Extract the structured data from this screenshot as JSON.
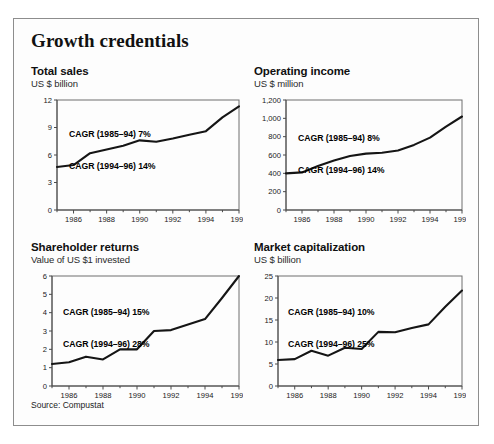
{
  "exhibit": {
    "title": "Growth credentials",
    "source": "Source: Compustat"
  },
  "panels": [
    {
      "key": "total-sales",
      "title": "Total sales",
      "subtitle": "US $ billion",
      "cagr_line1": "CAGR (1985–94) 7%",
      "cagr_line2": "CAGR (1994–96) 14%"
    },
    {
      "key": "operating-income",
      "title": "Operating income",
      "subtitle": "US $ million",
      "cagr_line1": "CAGR (1985–94) 8%",
      "cagr_line2": "CAGR (1994–96) 14%"
    },
    {
      "key": "shareholder-returns",
      "title": "Shareholder returns",
      "subtitle": "Value of US $1 invested",
      "cagr_line1": "CAGR (1985–94) 15%",
      "cagr_line2": "CAGR (1994–96) 28%"
    },
    {
      "key": "market-capitalization",
      "title": "Market capitalization",
      "subtitle": "US $ billion",
      "cagr_line1": "CAGR (1985–94) 10%",
      "cagr_line2": "CAGR (1994–96) 25%"
    }
  ],
  "chart_data": [
    {
      "type": "line",
      "title": "Total sales",
      "subtitle": "US $ billion",
      "xlabel": "",
      "ylabel": "US $ billion",
      "x": [
        1985,
        1986,
        1987,
        1988,
        1989,
        1990,
        1991,
        1992,
        1993,
        1994,
        1995,
        1996
      ],
      "values": [
        4.7,
        4.9,
        6.2,
        6.6,
        7.0,
        7.6,
        7.45,
        7.8,
        8.2,
        8.6,
        10.1,
        11.3
      ],
      "xlim": [
        1985,
        1996
      ],
      "ylim": [
        0,
        12
      ],
      "yticks": [
        0,
        3,
        6,
        9,
        12
      ],
      "yticklabels": [
        "0",
        "3",
        "6",
        "9",
        "12"
      ],
      "xticks": [
        1986,
        1988,
        1990,
        1992,
        1994,
        1996
      ],
      "xticklabels": [
        "1986",
        "1988",
        "1990",
        "1992",
        "1994",
        "1996"
      ],
      "grid": false,
      "legend": "none",
      "annotations": [
        "CAGR (1985–94) 7%",
        "CAGR (1994–96) 14%"
      ]
    },
    {
      "type": "line",
      "title": "Operating income",
      "subtitle": "US $ million",
      "xlabel": "",
      "ylabel": "US $ million",
      "x": [
        1985,
        1986,
        1987,
        1988,
        1989,
        1990,
        1991,
        1992,
        1993,
        1994,
        1995,
        1996
      ],
      "values": [
        400,
        410,
        480,
        540,
        590,
        615,
        625,
        650,
        710,
        790,
        910,
        1020
      ],
      "xlim": [
        1985,
        1996
      ],
      "ylim": [
        0,
        1200
      ],
      "yticks": [
        0,
        200,
        400,
        600,
        800,
        1000,
        1200
      ],
      "yticklabels": [
        "0",
        "200",
        "400",
        "600",
        "800",
        "1,000",
        "1,200"
      ],
      "xticks": [
        1986,
        1988,
        1990,
        1992,
        1994,
        1996
      ],
      "xticklabels": [
        "1986",
        "1988",
        "1990",
        "1992",
        "1994",
        "1996"
      ],
      "grid": false,
      "legend": "none",
      "annotations": [
        "CAGR (1985–94) 8%",
        "CAGR (1994–96) 14%"
      ]
    },
    {
      "type": "line",
      "title": "Shareholder returns",
      "subtitle": "Value of US $1 invested",
      "xlabel": "",
      "ylabel": "Value of US $1 invested",
      "x": [
        1985,
        1986,
        1987,
        1988,
        1989,
        1990,
        1991,
        1992,
        1993,
        1994,
        1995,
        1996
      ],
      "values": [
        1.2,
        1.3,
        1.6,
        1.45,
        2.0,
        2.0,
        3.0,
        3.05,
        3.35,
        3.65,
        4.8,
        6.0
      ],
      "xlim": [
        1985,
        1996
      ],
      "ylim": [
        0,
        6
      ],
      "yticks": [
        0,
        1,
        2,
        3,
        4,
        5,
        6
      ],
      "yticklabels": [
        "0",
        "1",
        "2",
        "3",
        "4",
        "5",
        "6"
      ],
      "xticks": [
        1986,
        1988,
        1990,
        1992,
        1994,
        1996
      ],
      "xticklabels": [
        "1986",
        "1988",
        "1990",
        "1992",
        "1994",
        "1996"
      ],
      "grid": false,
      "legend": "none",
      "annotations": [
        "CAGR (1985–94) 15%",
        "CAGR (1994–96) 28%"
      ]
    },
    {
      "type": "line",
      "title": "Market capitalization",
      "subtitle": "US $ billion",
      "xlabel": "",
      "ylabel": "US $ billion",
      "x": [
        1985,
        1986,
        1987,
        1988,
        1989,
        1990,
        1991,
        1992,
        1993,
        1994,
        1995,
        1996
      ],
      "values": [
        5.9,
        6.1,
        8.0,
        6.9,
        8.7,
        8.4,
        12.3,
        12.2,
        13.2,
        14.0,
        18.0,
        21.7
      ],
      "xlim": [
        1985,
        1996
      ],
      "ylim": [
        0,
        25
      ],
      "yticks": [
        0,
        5,
        10,
        15,
        20,
        25
      ],
      "yticklabels": [
        "0",
        "5",
        "10",
        "15",
        "20",
        "25"
      ],
      "xticks": [
        1986,
        1988,
        1990,
        1992,
        1994,
        1996
      ],
      "xticklabels": [
        "1986",
        "1988",
        "1990",
        "1992",
        "1994",
        "1996"
      ],
      "grid": false,
      "legend": "none",
      "annotations": [
        "CAGR (1985–94) 10%",
        "CAGR (1994–96) 25%"
      ]
    }
  ]
}
